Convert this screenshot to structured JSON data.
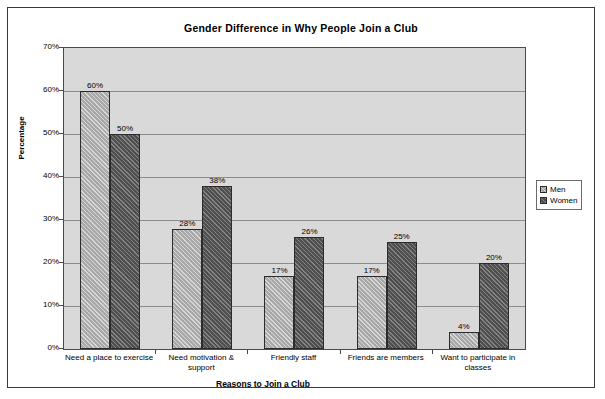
{
  "chart_data": {
    "type": "bar",
    "title": "Gender Difference in Why People Join a Club",
    "xlabel": "Reasons to Join a Club",
    "ylabel": "Percentage",
    "categories": [
      "Need a place to exercise",
      "Need motivation & support",
      "Friendly staff",
      "Friends are members",
      "Want to participate in classes"
    ],
    "series": [
      {
        "name": "Men",
        "values": [
          60,
          28,
          17,
          17,
          4
        ],
        "labels": [
          "60%",
          "28%",
          "17%",
          "17%",
          "4%"
        ],
        "color": "#a8a8a8"
      },
      {
        "name": "Women",
        "values": [
          50,
          38,
          26,
          25,
          20
        ],
        "labels": [
          "50%",
          "38%",
          "26%",
          "25%",
          "20%"
        ],
        "color": "#4f4f4f"
      }
    ],
    "ylim": [
      0,
      70
    ],
    "ytick_labels": [
      "70%",
      "60%",
      "50%",
      "40%",
      "30%",
      "20%",
      "10%",
      "0%"
    ],
    "ytick_values": [
      70,
      60,
      50,
      40,
      30,
      20,
      10,
      0
    ],
    "grid": "horizontal",
    "legend_position": "right",
    "plot_background": "#d9d9d9"
  }
}
